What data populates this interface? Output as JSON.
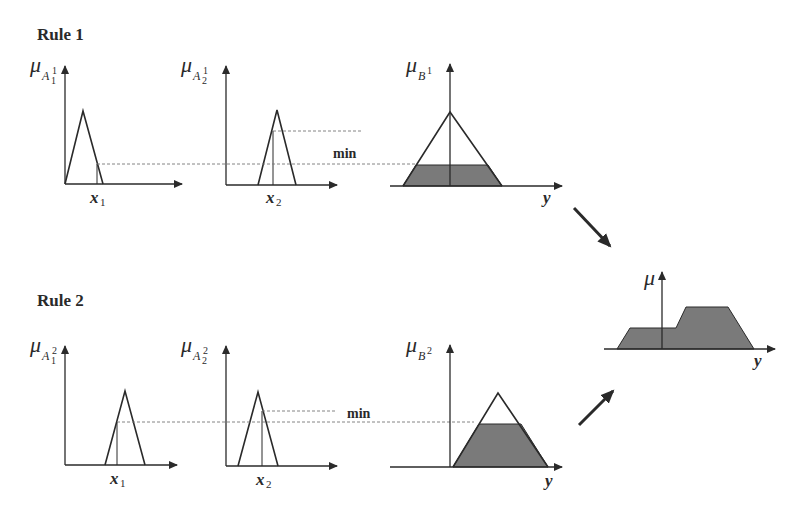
{
  "rules": [
    {
      "title": "Rule 1",
      "antecedent1": {
        "mu": "μ",
        "set": "A",
        "sub": "1",
        "sup": "1",
        "input": "x",
        "input_sub": "1"
      },
      "antecedent2": {
        "mu": "μ",
        "set": "A",
        "sub": "2",
        "sup": "1",
        "input": "x",
        "input_sub": "2"
      },
      "operator": "min",
      "consequent": {
        "mu": "μ",
        "set": "B",
        "sup": "1",
        "axis": "y"
      }
    },
    {
      "title": "Rule 2",
      "antecedent1": {
        "mu": "μ",
        "set": "A",
        "sub": "1",
        "sup": "2",
        "input": "x",
        "input_sub": "1"
      },
      "antecedent2": {
        "mu": "μ",
        "set": "A",
        "sub": "2",
        "sup": "2",
        "input": "x",
        "input_sub": "2"
      },
      "operator": "min",
      "consequent": {
        "mu": "μ",
        "set": "B",
        "sup": "2",
        "axis": "y"
      }
    }
  ],
  "aggregate": {
    "mu": "μ",
    "axis": "y"
  },
  "colors": {
    "ink": "#2a2a2a",
    "shade": "#7a7a7a",
    "guide": "#777777",
    "background": "#ffffff"
  }
}
